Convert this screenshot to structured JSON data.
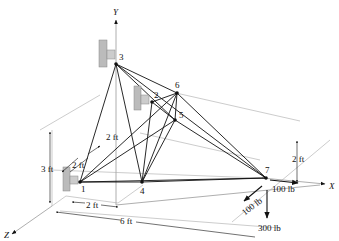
{
  "diagram": {
    "type": "space-truss",
    "axes": {
      "x": "X",
      "y": "Y",
      "z": "Z"
    },
    "nodes": [
      {
        "id": "1",
        "label": "1",
        "support": true
      },
      {
        "id": "2",
        "label": "2",
        "support": true
      },
      {
        "id": "3",
        "label": "3",
        "support": true
      },
      {
        "id": "4",
        "label": "4",
        "support": false
      },
      {
        "id": "5",
        "label": "5",
        "support": false
      },
      {
        "id": "6",
        "label": "6",
        "support": false
      },
      {
        "id": "7",
        "label": "7",
        "support": false
      }
    ],
    "members": [
      [
        "1",
        "4"
      ],
      [
        "1",
        "5"
      ],
      [
        "1",
        "6"
      ],
      [
        "1",
        "7"
      ],
      [
        "2",
        "4"
      ],
      [
        "2",
        "5"
      ],
      [
        "2",
        "6"
      ],
      [
        "3",
        "4"
      ],
      [
        "3",
        "5"
      ],
      [
        "3",
        "6"
      ],
      [
        "3",
        "7"
      ],
      [
        "3",
        "1"
      ],
      [
        "4",
        "5"
      ],
      [
        "4",
        "6"
      ],
      [
        "4",
        "7"
      ],
      [
        "5",
        "6"
      ],
      [
        "5",
        "7"
      ],
      [
        "6",
        "7"
      ]
    ],
    "dimensions": [
      {
        "id": "dim-height",
        "label": "3 ft"
      },
      {
        "id": "dim-z-support-upper",
        "label": "2 ft"
      },
      {
        "id": "dim-z-support-lower",
        "label": "2 ft"
      },
      {
        "id": "dim-x-1-4",
        "label": "2 ft"
      },
      {
        "id": "dim-x-total",
        "label": "6 ft"
      },
      {
        "id": "dim-y-7",
        "label": "2 ft"
      }
    ],
    "loads": [
      {
        "id": "load-x",
        "label": "100 lb",
        "direction": "+X"
      },
      {
        "id": "load-z",
        "label": "100 lb",
        "direction": "+Z"
      },
      {
        "id": "load-y",
        "label": "300 lb",
        "direction": "-Y"
      }
    ]
  }
}
